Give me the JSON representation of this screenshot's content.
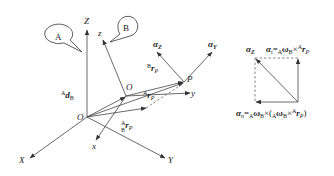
{
  "diagram": {
    "frames": {
      "A": {
        "callout": "A",
        "origin": "O",
        "axes": [
          "X",
          "Y",
          "Z"
        ]
      },
      "B": {
        "callout": "B",
        "origin": "O",
        "axes": [
          "x",
          "y",
          "z"
        ]
      }
    },
    "point": "P",
    "vectors": {
      "d_AB": {
        "pre_sup": "A",
        "symbol": "d",
        "sub": "B"
      },
      "r_BP": {
        "pre_sup": "B",
        "symbol": "r",
        "sub": "P"
      },
      "r_AP": {
        "pre_sup": "A",
        "symbol": "r",
        "sub": "P"
      },
      "r_ABP": {
        "pre_sup": "A",
        "pre_sub": "B",
        "symbol": "r",
        "sub": "P"
      }
    },
    "accelerations": {
      "alpha_Z": {
        "symbol": "α",
        "sub": "Z"
      },
      "alpha_Y": {
        "symbol": "α",
        "sub": "Y"
      }
    },
    "decomposition": {
      "alpha_Z_label": {
        "symbol": "α",
        "sub": "Z"
      },
      "tangential": {
        "lhs_symbol": "α",
        "lhs_sub": "t",
        "eq": "=",
        "pre_sub1": "A",
        "omega": "ω",
        "omega_sub": "B",
        "cross": "×",
        "r_pre_sup": "A",
        "r_pre_sub": "B",
        "r": "r",
        "r_sub": "P"
      },
      "normal": {
        "lhs_symbol": "α",
        "lhs_sub": "n",
        "eq": "=",
        "pre_sub1": "A",
        "omega": "ω",
        "omega_sub": "B",
        "cross": "×",
        "open": "(",
        "pre_sub2": "A",
        "omega2": "ω",
        "omega2_sub": "B",
        "cross2": "×",
        "r_pre_sup": "A",
        "r_pre_sub": "B",
        "r": "r",
        "r_sub": "P",
        "close": ")"
      }
    }
  }
}
